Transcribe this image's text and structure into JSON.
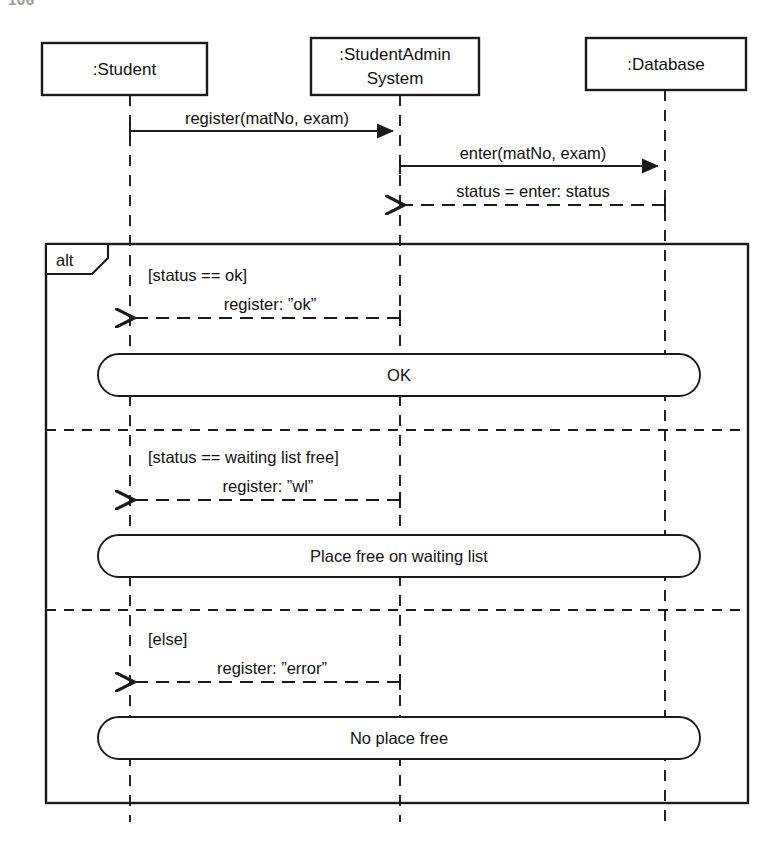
{
  "page": {
    "number": "106",
    "diagram_type": "uml-sequence-diagram"
  },
  "colors": {
    "line": "#1a1a1a",
    "text": "#111111",
    "background": "#ffffff",
    "page_number": "#9a9a9a"
  },
  "lifelines": [
    {
      "id": "student",
      "label": ":Student",
      "x": 130,
      "box": {
        "x": 42,
        "y": 43,
        "w": 165,
        "h": 52
      }
    },
    {
      "id": "studentadmin",
      "label": ":StudentAdmin\nSystem",
      "line1": ":StudentAdmin",
      "line2": "System",
      "x": 400,
      "box": {
        "x": 311,
        "y": 38,
        "w": 168,
        "h": 57
      }
    },
    {
      "id": "database",
      "label": ":Database",
      "x": 665,
      "box": {
        "x": 586,
        "y": 38,
        "w": 160,
        "h": 52
      }
    }
  ],
  "messages": [
    {
      "id": "register",
      "label": "register(matNo, exam)",
      "from": "student",
      "to": "studentadmin",
      "style": "solid",
      "y": 131
    },
    {
      "id": "enter",
      "label": "enter(matNo, exam)",
      "from": "studentadmin",
      "to": "database",
      "style": "solid",
      "y": 166
    },
    {
      "id": "status-return",
      "label": "status = enter: status",
      "from": "database",
      "to": "studentadmin",
      "style": "dashed",
      "y": 205
    },
    {
      "id": "register-ok",
      "label": "register: ”ok”",
      "from": "studentadmin",
      "to": "student",
      "style": "dashed",
      "y": 318
    },
    {
      "id": "register-wl",
      "label": "register: ”wl”",
      "from": "studentadmin",
      "to": "student",
      "style": "dashed",
      "y": 500
    },
    {
      "id": "register-error",
      "label": "register: ”error”",
      "from": "studentadmin",
      "to": "student",
      "style": "dashed",
      "y": 682
    }
  ],
  "fragment": {
    "operator": "alt",
    "frame": {
      "x": 46,
      "y": 244,
      "w": 702,
      "h": 559
    },
    "tag": {
      "w": 62,
      "h": 30
    },
    "dividers": [
      430,
      610
    ],
    "operands": [
      {
        "guard": "[status == ok]",
        "guard_x": 150,
        "guard_y": 275,
        "action": "OK",
        "action_box": {
          "x": 98,
          "y": 354,
          "w": 602,
          "h": 42
        }
      },
      {
        "guard": "[status == waiting list free]",
        "guard_x": 150,
        "guard_y": 460,
        "action": "Place free on waiting list",
        "action_box": {
          "x": 98,
          "y": 535,
          "w": 602,
          "h": 42
        }
      },
      {
        "guard": "[else]",
        "guard_x": 150,
        "guard_y": 641,
        "action": "No place free",
        "action_box": {
          "x": 98,
          "y": 717,
          "w": 602,
          "h": 42
        }
      }
    ]
  }
}
